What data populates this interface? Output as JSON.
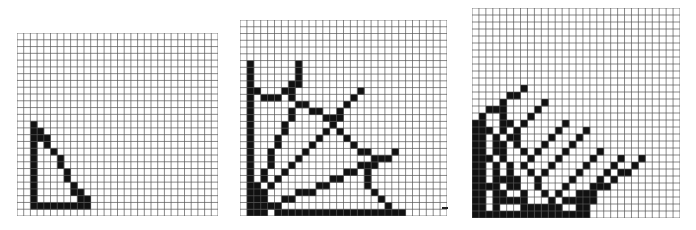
{
  "figure": {
    "grid_color": "#555555",
    "fill_color": "#111111",
    "background": "#ffffff"
  },
  "panels": [
    {
      "id": "panel-1",
      "left": 17,
      "top": 33,
      "width": 201,
      "height": 183,
      "cols": 30,
      "rows": 27,
      "cells": [
        [
          2,
          13
        ],
        [
          2,
          14
        ],
        [
          2,
          15
        ],
        [
          2,
          16
        ],
        [
          2,
          17
        ],
        [
          2,
          18
        ],
        [
          2,
          19
        ],
        [
          2,
          20
        ],
        [
          2,
          21
        ],
        [
          2,
          22
        ],
        [
          2,
          23
        ],
        [
          2,
          24
        ],
        [
          2,
          25
        ],
        [
          3,
          14
        ],
        [
          3,
          15
        ],
        [
          3,
          25
        ],
        [
          4,
          15
        ],
        [
          4,
          16
        ],
        [
          4,
          25
        ],
        [
          5,
          17
        ],
        [
          5,
          25
        ],
        [
          6,
          18
        ],
        [
          6,
          19
        ],
        [
          6,
          25
        ],
        [
          7,
          20
        ],
        [
          7,
          21
        ],
        [
          7,
          25
        ],
        [
          8,
          22
        ],
        [
          8,
          23
        ],
        [
          8,
          25
        ],
        [
          9,
          23
        ],
        [
          9,
          24
        ],
        [
          9,
          25
        ],
        [
          10,
          24
        ],
        [
          10,
          25
        ]
      ]
    },
    {
      "id": "panel-2",
      "left": 240,
      "top": 20,
      "width": 207,
      "height": 196,
      "cols": 30,
      "rows": 29,
      "cells": [
        [
          1,
          6
        ],
        [
          1,
          7
        ],
        [
          1,
          8
        ],
        [
          1,
          9
        ],
        [
          1,
          10
        ],
        [
          1,
          11
        ],
        [
          1,
          12
        ],
        [
          1,
          13
        ],
        [
          1,
          14
        ],
        [
          1,
          15
        ],
        [
          1,
          16
        ],
        [
          1,
          17
        ],
        [
          1,
          18
        ],
        [
          1,
          19
        ],
        [
          1,
          20
        ],
        [
          1,
          21
        ],
        [
          1,
          22
        ],
        [
          1,
          23
        ],
        [
          1,
          24
        ],
        [
          1,
          25
        ],
        [
          1,
          26
        ],
        [
          1,
          27
        ],
        [
          2,
          24
        ],
        [
          2,
          25
        ],
        [
          2,
          26
        ],
        [
          2,
          27
        ],
        [
          3,
          25
        ],
        [
          3,
          26
        ],
        [
          3,
          27
        ],
        [
          2,
          10
        ],
        [
          3,
          11
        ],
        [
          4,
          11
        ],
        [
          5,
          11
        ],
        [
          6,
          10
        ],
        [
          7,
          10
        ],
        [
          8,
          9
        ],
        [
          8,
          6
        ],
        [
          8,
          7
        ],
        [
          8,
          8
        ],
        [
          7,
          9
        ],
        [
          7,
          11
        ],
        [
          8,
          12
        ],
        [
          9,
          12
        ],
        [
          10,
          13
        ],
        [
          11,
          13
        ],
        [
          12,
          14
        ],
        [
          13,
          14
        ],
        [
          13,
          15
        ],
        [
          14,
          14
        ],
        [
          14,
          13
        ],
        [
          15,
          12
        ],
        [
          16,
          11
        ],
        [
          17,
          10
        ],
        [
          14,
          16
        ],
        [
          15,
          17
        ],
        [
          16,
          18
        ],
        [
          17,
          19
        ],
        [
          18,
          19
        ],
        [
          19,
          20
        ],
        [
          19,
          21
        ],
        [
          20,
          20
        ],
        [
          21,
          20
        ],
        [
          22,
          19
        ],
        [
          18,
          21
        ],
        [
          18,
          22
        ],
        [
          18,
          23
        ],
        [
          18,
          24
        ],
        [
          19,
          25
        ],
        [
          20,
          26
        ],
        [
          21,
          27
        ],
        [
          7,
          13
        ],
        [
          7,
          14
        ],
        [
          6,
          15
        ],
        [
          6,
          16
        ],
        [
          5,
          17
        ],
        [
          5,
          18
        ],
        [
          4,
          19
        ],
        [
          4,
          20
        ],
        [
          4,
          21
        ],
        [
          3,
          22
        ],
        [
          3,
          23
        ],
        [
          12,
          16
        ],
        [
          11,
          17
        ],
        [
          10,
          18
        ],
        [
          9,
          19
        ],
        [
          8,
          20
        ],
        [
          7,
          21
        ],
        [
          6,
          22
        ],
        [
          5,
          23
        ],
        [
          4,
          24
        ],
        [
          17,
          21
        ],
        [
          16,
          22
        ],
        [
          15,
          22
        ],
        [
          14,
          23
        ],
        [
          13,
          23
        ],
        [
          12,
          24
        ],
        [
          11,
          24
        ],
        [
          10,
          25
        ],
        [
          9,
          25
        ],
        [
          8,
          25
        ],
        [
          7,
          26
        ],
        [
          6,
          26
        ],
        [
          5,
          27
        ],
        [
          4,
          27
        ],
        [
          5,
          28
        ],
        [
          6,
          28
        ],
        [
          7,
          28
        ],
        [
          8,
          28
        ],
        [
          9,
          28
        ],
        [
          10,
          28
        ],
        [
          11,
          28
        ],
        [
          12,
          28
        ],
        [
          13,
          28
        ],
        [
          14,
          28
        ],
        [
          15,
          28
        ],
        [
          16,
          28
        ],
        [
          17,
          28
        ],
        [
          18,
          28
        ],
        [
          19,
          28
        ],
        [
          20,
          28
        ],
        [
          21,
          28
        ],
        [
          22,
          28
        ],
        [
          23,
          28
        ],
        [
          2,
          28
        ],
        [
          3,
          28
        ],
        [
          1,
          28
        ]
      ],
      "stray_mark": {
        "left": 442,
        "top": 207,
        "width": 6,
        "height": 2
      }
    },
    {
      "id": "panel-3",
      "left": 472,
      "top": 8,
      "width": 208,
      "height": 210,
      "cols": 30,
      "rows": 30,
      "cells": [
        [
          0,
          16
        ],
        [
          0,
          17
        ],
        [
          0,
          18
        ],
        [
          0,
          19
        ],
        [
          0,
          20
        ],
        [
          0,
          21
        ],
        [
          0,
          22
        ],
        [
          0,
          23
        ],
        [
          0,
          24
        ],
        [
          0,
          25
        ],
        [
          0,
          26
        ],
        [
          0,
          27
        ],
        [
          0,
          28
        ],
        [
          0,
          29
        ],
        [
          1,
          16
        ],
        [
          1,
          17
        ],
        [
          1,
          18
        ],
        [
          1,
          19
        ],
        [
          1,
          20
        ],
        [
          1,
          21
        ],
        [
          1,
          22
        ],
        [
          1,
          23
        ],
        [
          1,
          24
        ],
        [
          1,
          25
        ],
        [
          1,
          26
        ],
        [
          1,
          27
        ],
        [
          1,
          28
        ],
        [
          1,
          29
        ],
        [
          1,
          15
        ],
        [
          2,
          14
        ],
        [
          3,
          14
        ],
        [
          4,
          13
        ],
        [
          5,
          12
        ],
        [
          6,
          12
        ],
        [
          7,
          11
        ],
        [
          2,
          17
        ],
        [
          3,
          18
        ],
        [
          3,
          19
        ],
        [
          4,
          20
        ],
        [
          4,
          21
        ],
        [
          5,
          22
        ],
        [
          5,
          23
        ],
        [
          6,
          24
        ],
        [
          6,
          25
        ],
        [
          7,
          26
        ],
        [
          7,
          27
        ],
        [
          8,
          28
        ],
        [
          9,
          28
        ],
        [
          3,
          22
        ],
        [
          3,
          23
        ],
        [
          3,
          24
        ],
        [
          3,
          25
        ],
        [
          3,
          26
        ],
        [
          3,
          27
        ],
        [
          3,
          28
        ],
        [
          2,
          29
        ],
        [
          3,
          29
        ],
        [
          4,
          29
        ],
        [
          5,
          29
        ],
        [
          6,
          29
        ],
        [
          7,
          29
        ],
        [
          8,
          29
        ],
        [
          9,
          29
        ],
        [
          10,
          29
        ],
        [
          11,
          29
        ],
        [
          12,
          29
        ],
        [
          13,
          29
        ],
        [
          14,
          29
        ],
        [
          15,
          29
        ],
        [
          16,
          29
        ],
        [
          4,
          14
        ],
        [
          4,
          15
        ],
        [
          4,
          16
        ],
        [
          4,
          17
        ],
        [
          5,
          16
        ],
        [
          6,
          17
        ],
        [
          7,
          16
        ],
        [
          8,
          15
        ],
        [
          9,
          14
        ],
        [
          10,
          13
        ],
        [
          6,
          18
        ],
        [
          6,
          19
        ],
        [
          7,
          20
        ],
        [
          8,
          21
        ],
        [
          9,
          20
        ],
        [
          10,
          19
        ],
        [
          11,
          18
        ],
        [
          12,
          17
        ],
        [
          13,
          16
        ],
        [
          7,
          22
        ],
        [
          8,
          23
        ],
        [
          9,
          24
        ],
        [
          10,
          23
        ],
        [
          11,
          22
        ],
        [
          12,
          21
        ],
        [
          13,
          20
        ],
        [
          14,
          19
        ],
        [
          15,
          18
        ],
        [
          16,
          17
        ],
        [
          9,
          25
        ],
        [
          10,
          26
        ],
        [
          11,
          27
        ],
        [
          12,
          26
        ],
        [
          13,
          25
        ],
        [
          14,
          24
        ],
        [
          15,
          23
        ],
        [
          16,
          22
        ],
        [
          17,
          21
        ],
        [
          18,
          20
        ],
        [
          12,
          28
        ],
        [
          13,
          27
        ],
        [
          14,
          27
        ],
        [
          15,
          26
        ],
        [
          16,
          26
        ],
        [
          17,
          25
        ],
        [
          18,
          24
        ],
        [
          19,
          23
        ],
        [
          20,
          22
        ],
        [
          21,
          21
        ],
        [
          4,
          26
        ],
        [
          5,
          25
        ],
        [
          6,
          24
        ],
        [
          4,
          27
        ],
        [
          5,
          27
        ],
        [
          6,
          27
        ],
        [
          7,
          28
        ],
        [
          15,
          28
        ],
        [
          15,
          27
        ],
        [
          16,
          27
        ],
        [
          16,
          28
        ],
        [
          17,
          26
        ],
        [
          17,
          27
        ],
        [
          18,
          25
        ],
        [
          19,
          25
        ],
        [
          20,
          24
        ],
        [
          21,
          23
        ],
        [
          22,
          23
        ],
        [
          23,
          22
        ],
        [
          24,
          21
        ],
        [
          2,
          21
        ],
        [
          3,
          20
        ],
        [
          4,
          19
        ],
        [
          5,
          18
        ],
        [
          2,
          25
        ],
        [
          3,
          25
        ],
        [
          4,
          24
        ],
        [
          5,
          24
        ],
        [
          11,
          28
        ],
        [
          10,
          28
        ]
      ]
    }
  ]
}
